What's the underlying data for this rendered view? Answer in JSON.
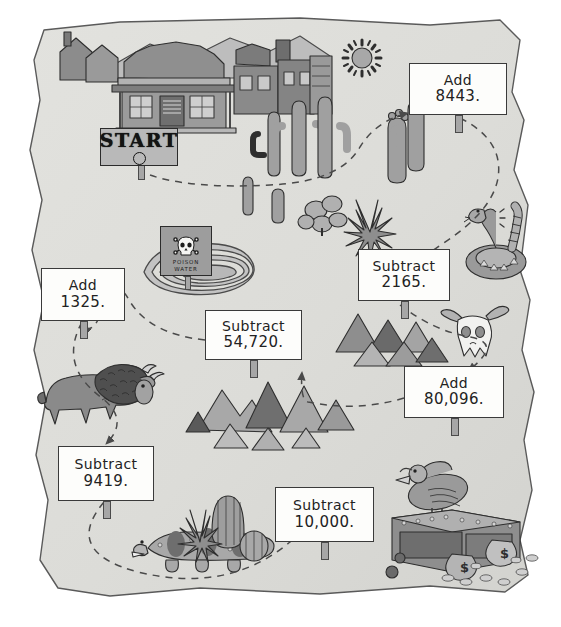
{
  "worksheet": {
    "type": "desert treasure map math path",
    "paper_color": "#dcdcd8",
    "ink_color": "#3a3a3a",
    "sign_face_color": "#fdfdfb"
  },
  "start": {
    "label": "START",
    "name": "start-sign"
  },
  "hazard_sign": {
    "line1": "POISON",
    "line2": "WATER",
    "icon": "skull-and-crossbones"
  },
  "steps": [
    {
      "id": "step-1",
      "operation": "Add",
      "value": "8443.",
      "line1": "Add",
      "line2": "8443.",
      "x": 409,
      "y": 63,
      "w": 98,
      "h": 52
    },
    {
      "id": "step-2",
      "operation": "Subtract",
      "value": "2165.",
      "line1": "Subtract",
      "line2": "2165.",
      "x": 358,
      "y": 249,
      "w": 92,
      "h": 52
    },
    {
      "id": "step-3",
      "operation": "Add",
      "value": "80,096.",
      "line1": "Add",
      "line2": "80,096.",
      "x": 404,
      "y": 366,
      "w": 100,
      "h": 52
    },
    {
      "id": "step-4",
      "operation": "Subtract",
      "value": "10,000.",
      "line1": "Subtract",
      "line2": "10,000.",
      "x": 275,
      "y": 487,
      "w": 99,
      "h": 55
    },
    {
      "id": "step-5",
      "operation": "Subtract",
      "value": "9419.",
      "line1": "Subtract",
      "line2": "9419.",
      "x": 58,
      "y": 446,
      "w": 96,
      "h": 55
    },
    {
      "id": "step-6",
      "operation": "Add",
      "value": "1325.",
      "line1": "Add",
      "line2": "1325.",
      "x": 41,
      "y": 268,
      "w": 84,
      "h": 53
    },
    {
      "id": "step-7",
      "operation": "Subtract",
      "value": "54,720.",
      "line1": "Subtract",
      "line2": "54,720.",
      "x": 205,
      "y": 310,
      "w": 97,
      "h": 50
    }
  ],
  "scenery": [
    {
      "name": "saloon-town-buildings"
    },
    {
      "name": "sun-icon"
    },
    {
      "name": "saguaro-cactus-cluster"
    },
    {
      "name": "prickly-pear-cactus"
    },
    {
      "name": "agave-plant"
    },
    {
      "name": "rattlesnake"
    },
    {
      "name": "cow-skull"
    },
    {
      "name": "poison-water-pond"
    },
    {
      "name": "bison"
    },
    {
      "name": "mountain-range"
    },
    {
      "name": "gila-monster-lizard"
    },
    {
      "name": "barrel-cactus"
    },
    {
      "name": "vulture"
    },
    {
      "name": "treasure-chest"
    },
    {
      "name": "money-bags"
    },
    {
      "name": "gold-coins"
    }
  ]
}
